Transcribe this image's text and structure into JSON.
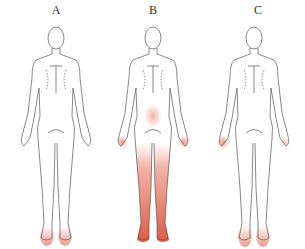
{
  "figures": [
    {
      "label": "A",
      "shaded_regions": [
        "feet"
      ]
    },
    {
      "label": "B",
      "shaded_regions": [
        "lower-abdomen",
        "hands",
        "legs",
        "feet"
      ]
    },
    {
      "label": "C",
      "shaded_regions": [
        "hands",
        "feet"
      ]
    }
  ],
  "colors": {
    "outline": "#555555",
    "shading": "#e0553a",
    "background": "#ffffff"
  }
}
